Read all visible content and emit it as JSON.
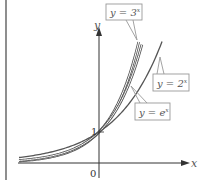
{
  "chart_data": {
    "type": "line",
    "title": "",
    "xlabel": "x",
    "ylabel": "y",
    "xlim": [
      -2.5,
      2.9
    ],
    "ylim": [
      -0.2,
      4.8
    ],
    "ticks": {
      "origin_label": "0",
      "y_tick_label": "1",
      "y_tick_value": 1
    },
    "grid": false,
    "series": [
      {
        "name": "y = 3^x",
        "label_text": "y = 3",
        "label_exp": "x",
        "base": 3,
        "x_range": [
          -2.5,
          1.24
        ],
        "style": "double"
      },
      {
        "name": "y = e^x",
        "label_text": "y = e",
        "label_exp": "x",
        "base": 2.718281828,
        "x_range": [
          -2.5,
          1.34
        ],
        "style": "double"
      },
      {
        "name": "y = 2^x",
        "label_text": "y = 2",
        "label_exp": "x",
        "base": 2,
        "x_range": [
          -2.5,
          1.97
        ],
        "style": "single"
      }
    ],
    "colors": {
      "curve": "#555555",
      "double_inner": "#ffffff",
      "axis": "#333333",
      "label_box": "#999999",
      "label_text": "#666666",
      "frame_line": "#444444"
    }
  }
}
